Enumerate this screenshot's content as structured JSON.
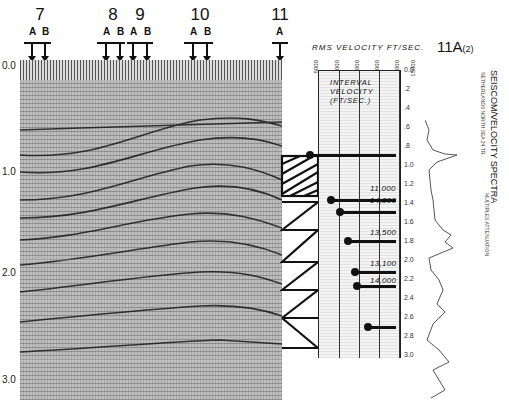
{
  "figure_id": {
    "main": "11A",
    "sub": "(2)"
  },
  "title": "SEISCOM/VELOCITY SPECTRA",
  "subtitle": "NETHERLANDS NORTH SEA 24 TR.",
  "process_note": "MULTIPLES ATTENUATION",
  "shotpoints": [
    {
      "number": "7",
      "labels": [
        "A",
        "B"
      ],
      "x": 34
    },
    {
      "number": "8",
      "labels": [
        "A",
        "B"
      ],
      "x": 112
    },
    {
      "number": "9",
      "labels": [
        "A",
        "B"
      ],
      "x": 139
    },
    {
      "number": "10",
      "labels": [
        "A",
        "B"
      ],
      "x": 198
    },
    {
      "number": "11",
      "labels": [
        "A"
      ],
      "x": 279
    }
  ],
  "seismic_section": {
    "time_axis_major": [
      "0.0",
      "1.0",
      "2.0",
      "3.0"
    ],
    "time_axis_unit": "sec"
  },
  "velocity_panel": {
    "rms_title": "RMS VELOCITY FT/SEC.",
    "rms_ticks": [
      "5000",
      "7000",
      "9000",
      "11000",
      "13000",
      "15000"
    ],
    "interval_label": [
      "INTERVAL",
      "VELOCITY",
      "(FT/SEC.)"
    ],
    "time_ticks": [
      "0.0",
      ".2",
      ".4",
      ".6",
      ".8",
      "1.0",
      "1.2",
      "1.4",
      "1.6",
      "1.8",
      "2.0",
      "2.2",
      "2.4",
      "2.6",
      "2.8",
      "3.0"
    ],
    "picks": [
      {
        "time": 0.8,
        "label": ""
      },
      {
        "time": 1.24,
        "label": "11,000"
      },
      {
        "time": 1.36,
        "label": "14,300"
      },
      {
        "time": 1.64,
        "label": "13,500"
      },
      {
        "time": 1.96,
        "label": "13,100"
      },
      {
        "time": 2.06,
        "label": "14,000"
      },
      {
        "time": 2.46,
        "label": ""
      }
    ]
  }
}
